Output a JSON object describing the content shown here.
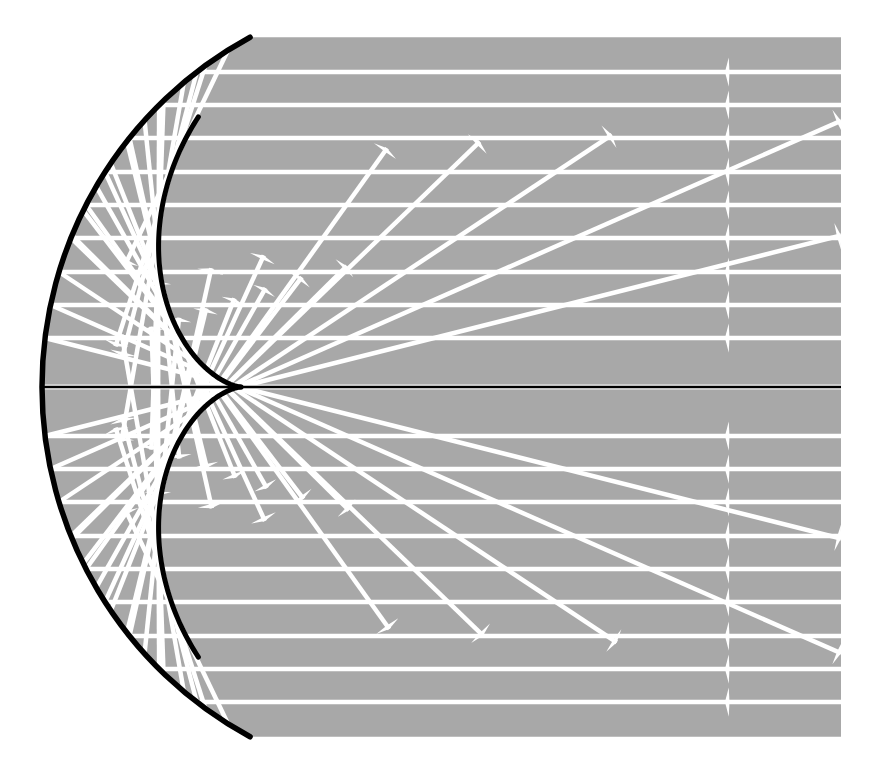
{
  "figure": {
    "name": "spherical-mirror-caustic",
    "title": "Caustic of a spherical mirror with parallel incident rays",
    "canvas": {
      "width": 871,
      "height": 770
    },
    "background_color": "#ffffff"
  },
  "colors": {
    "medium_fill": "#a8a8a8",
    "ray_color": "#ffffff",
    "mirror_color": "#000000",
    "axis_color": "#000000",
    "caustic_color": "#000000",
    "page_background": "#ffffff"
  },
  "geometry": {
    "optical_axis_y": 387,
    "mirror_vertex_x": 42,
    "mirror_center_x": 440,
    "mirror_radius": 398,
    "mirror_arc_top": {
      "x": 265,
      "y": 38
    },
    "mirror_arc_bottom": {
      "x": 265,
      "y": 735
    },
    "mirror_half_angle_deg": 61.5,
    "focal_point": {
      "x": 241,
      "y": 387
    },
    "cusp_point": {
      "x": 212,
      "y": 386
    },
    "caustic_top_end": {
      "x": 228,
      "y": 78
    },
    "caustic_bottom_end": {
      "x": 228,
      "y": 698
    },
    "gray_region": {
      "left": 42,
      "right": 841,
      "top": 43,
      "bottom": 735
    },
    "incoming_arrow_x": 725,
    "ray_stroke_width": 4.5,
    "mirror_stroke_width": 5.5,
    "caustic_stroke_width": 5.0,
    "axis_stroke_width": 2.5
  },
  "elements": {
    "mirror_label": "spherical mirror",
    "axis_label": "optical axis",
    "caustic_label": "caustic curve (cusp)",
    "incident_rays_label": "incident parallel rays",
    "reflected_rays_label": "reflected rays",
    "medium_label": "illuminated region"
  },
  "chart_data": {
    "type": "scatter",
    "title": "Caustic of a spherical mirror with parallel incident rays",
    "xlabel": "",
    "ylabel": "",
    "grid": false,
    "legend_position": "none",
    "axis_line_y": 387,
    "incident_ray_heights": [
      72,
      105,
      138,
      172,
      205,
      238,
      272,
      305,
      338,
      387,
      436,
      469,
      502,
      536,
      569,
      602,
      636,
      669,
      702
    ],
    "incident_ray_count": 19,
    "incident_ray_direction": "leftward",
    "incident_ray_start_x": 841,
    "incident_arrowhead_x": 725,
    "reflected_ray_count": 38,
    "mirror_arc": {
      "center_x": 440,
      "center_y": 387,
      "radius": 398,
      "start_angle_deg": 118.5,
      "end_angle_deg": 241.5
    },
    "caustic_curve_type": "nephroid-cusp",
    "caustic_cusp_x": 212,
    "caustic_cusp_y": 386
  }
}
